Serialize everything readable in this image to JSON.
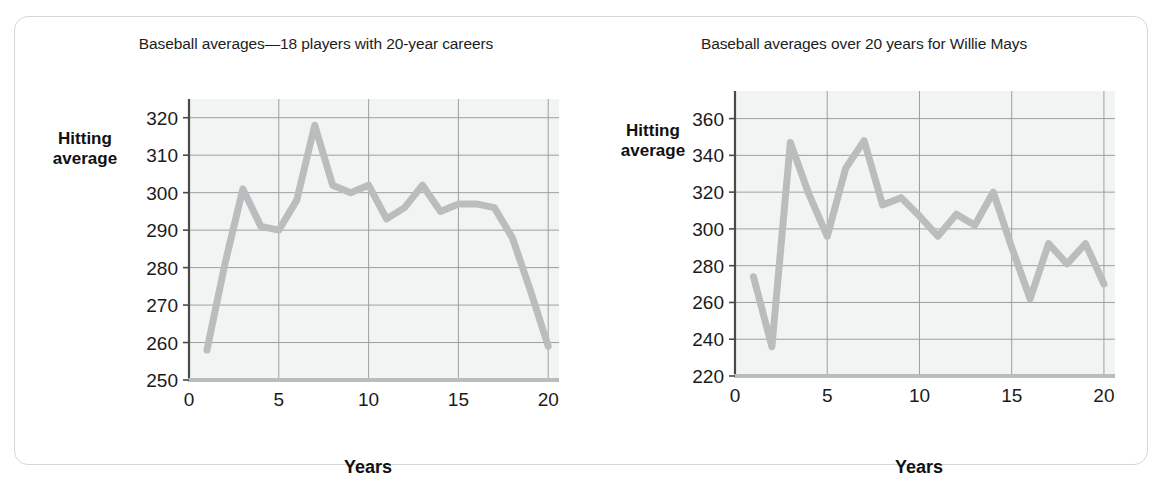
{
  "figure": {
    "background_color": "#ffffff",
    "frame_color": "#d5d7d8",
    "line_color": "#b9bdbd",
    "grid_color": "#9aa0a0",
    "axis_color": "#4a4a4a",
    "plot_background": "#f2f4f4"
  },
  "chart_data": [
    {
      "type": "line",
      "title": "Baseball averages—18 players with 20-year careers",
      "xlabel": "Years",
      "ylabel": "Hitting average",
      "ylabel_lines": [
        "Hitting",
        "average"
      ],
      "x": [
        1,
        2,
        3,
        4,
        5,
        6,
        7,
        8,
        9,
        10,
        11,
        12,
        13,
        14,
        15,
        16,
        17,
        18,
        19,
        20
      ],
      "values": [
        258,
        281,
        301,
        291,
        290,
        298,
        318,
        302,
        300,
        302,
        293,
        296,
        302,
        295,
        297,
        297,
        296,
        288,
        274,
        259
      ],
      "xlim": [
        0,
        20.6
      ],
      "ylim": [
        250,
        325
      ],
      "xticks": [
        0,
        5,
        10,
        15,
        20
      ],
      "yticks": [
        250,
        260,
        270,
        280,
        290,
        300,
        310,
        320
      ],
      "xtick_labels": [
        "0",
        "5",
        "10",
        "15",
        "20"
      ],
      "ytick_labels": [
        "250",
        "260",
        "270",
        "280",
        "290",
        "300",
        "310",
        "320"
      ],
      "grid": true,
      "legend": "none"
    },
    {
      "type": "line",
      "title": "Baseball averages over 20 years for Willie Mays",
      "xlabel": "Years",
      "ylabel": "Hitting average",
      "ylabel_lines": [
        "Hitting",
        "average"
      ],
      "x": [
        1,
        2,
        3,
        4,
        5,
        6,
        7,
        8,
        9,
        10,
        11,
        12,
        13,
        14,
        15,
        16,
        17,
        18,
        19,
        20
      ],
      "values": [
        274,
        236,
        347,
        319,
        296,
        333,
        348,
        313,
        317,
        307,
        296,
        308,
        302,
        320,
        290,
        262,
        292,
        281,
        292,
        270
      ],
      "xlim": [
        0,
        20.6
      ],
      "ylim": [
        220,
        375
      ],
      "xticks": [
        0,
        5,
        10,
        15,
        20
      ],
      "yticks": [
        220,
        240,
        260,
        280,
        300,
        320,
        340,
        360
      ],
      "xtick_labels": [
        "0",
        "5",
        "10",
        "15",
        "20"
      ],
      "ytick_labels": [
        "220",
        "240",
        "260",
        "280",
        "300",
        "320",
        "340",
        "360"
      ],
      "grid": true,
      "legend": "none"
    }
  ]
}
